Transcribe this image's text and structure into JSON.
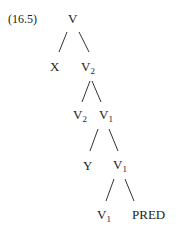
{
  "example_number": "(16.5)",
  "tree": {
    "root": {
      "label": "V",
      "sub": ""
    },
    "level1_left": {
      "label": "X",
      "sub": ""
    },
    "level1_right": {
      "label": "V",
      "sub": "2"
    },
    "level2_left": {
      "label": "V",
      "sub": "2"
    },
    "level2_right": {
      "label": "V",
      "sub": "1"
    },
    "level3_left": {
      "label": "Y",
      "sub": ""
    },
    "level3_right": {
      "label": "V",
      "sub": "1"
    },
    "level4_left": {
      "label": "V",
      "sub": "1"
    },
    "level4_right": {
      "label": "PRED",
      "sub": ""
    }
  },
  "colors": {
    "text": "#222222",
    "edge": "#333333",
    "background": "#ffffff"
  }
}
